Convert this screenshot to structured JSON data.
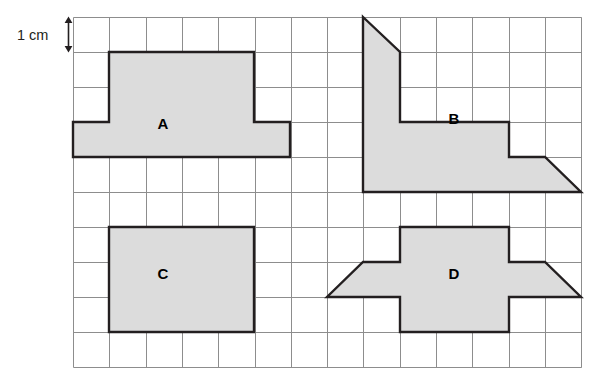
{
  "figure": {
    "kind": "grid-area-worksheet",
    "background_color": "#ffffff",
    "scale": {
      "label": "1 cm",
      "meaning": "one grid square side equals 1 cm",
      "indicator": "double-headed-vertical-arrow",
      "arrow_color": "#231f20"
    },
    "grid": {
      "columns": 14,
      "rows": 10,
      "cell_width_px": 36.3,
      "cell_height_px": 35,
      "origin_x_px": 73,
      "origin_y_px": 17,
      "line_color": "#8d8d8d",
      "line_width_px": 1,
      "outer_line_color": "#8d8d8d"
    },
    "shape_style": {
      "fill_color": "#dcdcdc",
      "outline_color": "#231f20",
      "outline_width_px": 2.4
    },
    "shapes": [
      {
        "id": "shape-a",
        "label": "A",
        "label_x_px": 163,
        "label_y_px": 129,
        "description": "T-shaped polygon: 4-wide by 2-tall top block on a 6-wide by 1-tall base",
        "points_px": "109,52 254,52 254,122 290,122 290,157 73,157 73,122 109,122",
        "area_cm2": 14
      },
      {
        "id": "shape-b",
        "label": "B",
        "label_x_px": 454,
        "label_y_px": 124,
        "description": "Stepped polygon with a triangular notch at top left and a triangular ramp at bottom right",
        "points_px": "363,17 400,52 400,122 509,122 509,157 545,157 581,192 363,192",
        "area_cm2": 14
      },
      {
        "id": "shape-c",
        "label": "C",
        "label_x_px": 163,
        "label_y_px": 279,
        "description": "Rectangle 4 squares wide by 3 squares tall",
        "points_px": "109,227 254,227 254,332 109,332",
        "area_cm2": 12
      },
      {
        "id": "shape-d",
        "label": "D",
        "label_x_px": 454,
        "label_y_px": 279,
        "description": "Cross-like polygon with sloping trapezoidal wings on the left and right",
        "points_px": "400,227 509,227 509,262 545,262 581,297 509,297 509,332 400,332 400,297 327,297 363,262 400,262",
        "area_cm2": 16
      }
    ],
    "shape_count": 4
  }
}
